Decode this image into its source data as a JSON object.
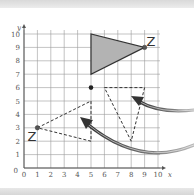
{
  "grid": {
    "x_min": 0,
    "x_max": 10,
    "y_min": 0,
    "y_max": 10,
    "x_axis_label": "x",
    "y_axis_label": "y",
    "x_ticks": [
      "0",
      "1",
      "2",
      "3",
      "4",
      "5",
      "6",
      "7",
      "8",
      "9",
      "10"
    ],
    "y_ticks": [
      "0",
      "1",
      "2",
      "3",
      "4",
      "5",
      "6",
      "7",
      "8",
      "9",
      "10"
    ],
    "origin_label": "0"
  },
  "shapes": {
    "shaded_triangle": {
      "vertices": [
        [
          5,
          10
        ],
        [
          5,
          7
        ],
        [
          9,
          9
        ]
      ],
      "fill": "#b3b3b3",
      "stroke": "#333333"
    },
    "dashed_triangle_right": {
      "vertices": [
        [
          6,
          6
        ],
        [
          9,
          6
        ],
        [
          8,
          2
        ]
      ],
      "style": "dashed"
    },
    "dashed_triangle_left": {
      "vertices": [
        [
          1,
          3
        ],
        [
          5,
          5
        ],
        [
          5,
          2
        ]
      ],
      "style": "dashed"
    }
  },
  "points": {
    "z_original": {
      "label": "Z",
      "coord": [
        9,
        9
      ]
    },
    "z_image": {
      "label": "Z",
      "coord": [
        1,
        3
      ]
    },
    "centre": {
      "coord": [
        5,
        6
      ]
    }
  },
  "arrows": [
    {
      "name": "pointer-to-right-triangle",
      "color": "#444444"
    },
    {
      "name": "pointer-to-left-triangle",
      "color": "#444444"
    }
  ],
  "colors": {
    "grid": "#9a9a9a",
    "axis": "#555555",
    "shape_stroke": "#333333"
  }
}
